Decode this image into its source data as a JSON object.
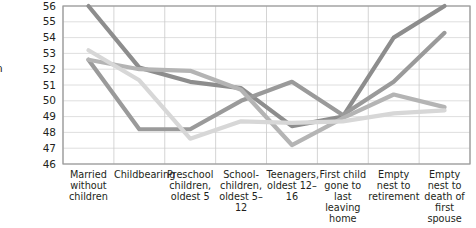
{
  "chart_data": {
    "type": "line",
    "title": "",
    "xlabel": "",
    "ylabel": "",
    "ylim": [
      46,
      56
    ],
    "yticks": [
      46,
      47,
      48,
      49,
      50,
      51,
      52,
      53,
      54,
      55,
      56
    ],
    "grid": true,
    "legend": "none",
    "categories": [
      "Married without children",
      "Childbearing",
      "Preschool children, oldest 5",
      "School-children, oldest 5–12",
      "Teenagers, oldest 12–16",
      "First child gone to last leaving home",
      "Empty nest to retirement",
      "Empty nest to death of first spouse"
    ],
    "series": [
      {
        "name": "series-1",
        "color": "#8d8d8d",
        "values": [
          56.0,
          52.1,
          51.2,
          50.8,
          48.4,
          49.0,
          54.0,
          56.0
        ]
      },
      {
        "name": "series-2",
        "color": "#9a9a9a",
        "values": [
          52.6,
          48.2,
          48.2,
          50.0,
          51.2,
          49.1,
          51.2,
          54.3
        ]
      },
      {
        "name": "series-3",
        "color": "#b4b4b4",
        "values": [
          52.6,
          52.0,
          51.9,
          50.7,
          47.2,
          48.9,
          50.4,
          49.6
        ]
      },
      {
        "name": "series-4",
        "color": "#d7d7d7",
        "values": [
          53.2,
          51.3,
          47.6,
          48.7,
          48.6,
          48.7,
          49.2,
          49.4
        ]
      }
    ]
  },
  "axis": {
    "y_title": "n"
  }
}
